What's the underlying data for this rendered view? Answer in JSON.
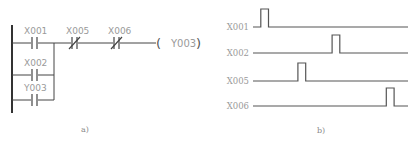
{
  "ladder": {
    "caption": "a)",
    "contacts": [
      {
        "label": "X001",
        "type": "NO"
      },
      {
        "label": "X005",
        "type": "NC"
      },
      {
        "label": "X006",
        "type": "NC"
      },
      {
        "label": "X002",
        "type": "NO"
      },
      {
        "label": "Y003",
        "type": "NO"
      }
    ],
    "coil": {
      "label": "Y003",
      "open": "(",
      "close": ")"
    }
  },
  "timing": {
    "caption": "b)",
    "signals": [
      {
        "label": "X001",
        "pulse_start": 0.05,
        "pulse_end": 0.1
      },
      {
        "label": "X002",
        "pulse_start": 0.51,
        "pulse_end": 0.56
      },
      {
        "label": "X005",
        "pulse_start": 0.29,
        "pulse_end": 0.34
      },
      {
        "label": "X006",
        "pulse_start": 0.86,
        "pulse_end": 0.91
      }
    ]
  }
}
